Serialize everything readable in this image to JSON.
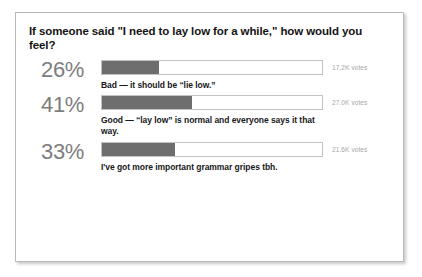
{
  "poll": {
    "question": "If someone said \"I need to lay low for a while,\" how would you feel?",
    "options": [
      {
        "percent": "26%",
        "label": "Bad — it should be “lie low.”",
        "votes": "17.2K votes"
      },
      {
        "percent": "41%",
        "label": "Good — “lay low” is normal and everyone says it that way.",
        "votes": "27.0K votes"
      },
      {
        "percent": "33%",
        "label": "I've got more important grammar gripes tbh.",
        "votes": "21.6K votes"
      }
    ]
  },
  "chart_data": {
    "type": "bar",
    "title": "If someone said \"I need to lay low for a while,\" how would you feel?",
    "categories": [
      "Bad — it should be “lie low.”",
      "Good — “lay low” is normal and everyone says it that way.",
      "I've got more important grammar gripes tbh."
    ],
    "values": [
      26,
      41,
      33
    ],
    "value_labels": [
      "26%",
      "41%",
      "33%"
    ],
    "counts": [
      17200,
      27000,
      21600
    ],
    "count_labels": [
      "17.2K votes",
      "27.0K votes",
      "21.6K votes"
    ],
    "xlabel": "",
    "ylabel": "",
    "xlim": [
      0,
      100
    ],
    "unit": "percent",
    "orientation": "horizontal",
    "grid": false,
    "legend": "none",
    "colors": {
      "bar_fill": "#6e6e6e",
      "bar_track": "#ffffff",
      "bar_border": "#c3c3c3",
      "percent_text": "#7d7d7d",
      "label_text": "#16181a",
      "votes_text": "#a7a7a7",
      "card_border": "#b9b9b9",
      "background": "#ffffff"
    }
  }
}
